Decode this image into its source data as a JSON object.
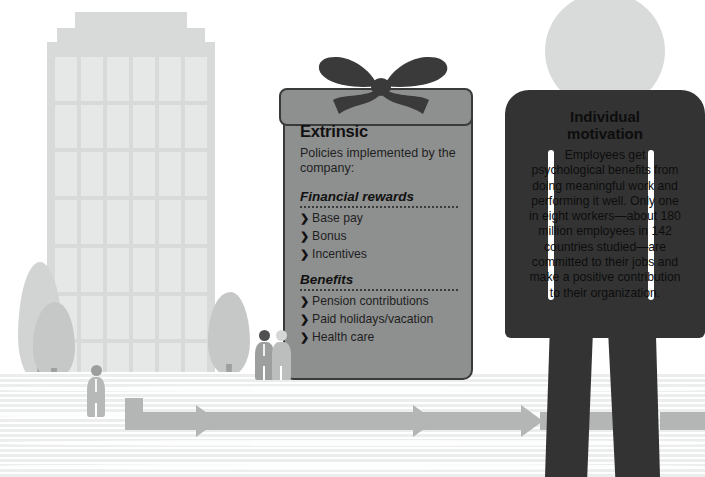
{
  "scene": {
    "title": "Extrinsic and individual motivation infographic",
    "width": 705,
    "height": 477
  },
  "palette": {
    "background": "#ffffff",
    "building": "#d8d9d9",
    "window": "#e6e7e7",
    "ground_stripe": "#eceded",
    "arrow": "#b4b5b5",
    "gift_box": "#8e8f8f",
    "gift_outline": "#3a3a3a",
    "bow": "#3a3a3a",
    "figure_dark": "#333333",
    "figure_head": "#d9dada",
    "tree_crown": "#d2d3d3",
    "tree_trunk": "#9e9f9f",
    "text_dark": "#111111"
  },
  "gift_panel": {
    "title": "Extrinsic",
    "subtitle": "Policies implemented by the company:",
    "sections": [
      {
        "heading": "Financial rewards",
        "items": [
          "Base pay",
          "Bonus",
          "Incentives"
        ]
      },
      {
        "heading": "Benefits",
        "items": [
          "Pension contributions",
          "Paid holidays/vacation",
          "Health care"
        ]
      }
    ],
    "bullet_glyph": "❯"
  },
  "figure_panel": {
    "title": "Individual motivation",
    "title_line1": "Individual",
    "title_line2": "motivation",
    "body": "Employees get psychological benefits from doing meaningful work and performing it well. Only one in eight workers—about 180 million employees in 142 countries studied—are committed to their jobs and make a positive contribution to their organization.",
    "stat_fraction": "one in eight",
    "stat_employees": "180 million",
    "stat_countries": "142"
  },
  "scenery": {
    "building_label": "office-building",
    "window_columns": 6,
    "window_rows": 7,
    "trees": [
      "poplar-tall",
      "poplar-short",
      "round-tree-left",
      "round-tree-right"
    ],
    "small_people": [
      "worker-alone",
      "worker-pair-dark",
      "worker-pair-light",
      "worker-right"
    ],
    "arrow_label": "progress-arrow"
  }
}
